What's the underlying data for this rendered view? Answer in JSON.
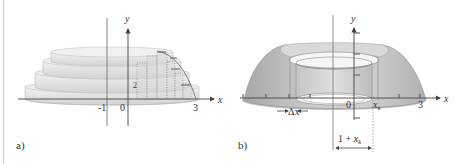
{
  "figure": {
    "panels": [
      {
        "id": "a",
        "label": "a)",
        "description": "Solid of revolution approximated by stacked cylindrical disks (step solid) with dotted rectangles",
        "axes": {
          "x_label": "x",
          "y_label": "y",
          "tick_labels": [
            "-1",
            "0",
            "3"
          ],
          "annotation": "2"
        }
      },
      {
        "id": "b",
        "label": "b)",
        "description": "Solid of revolution about x = -1 with a cylindrical shell of thickness Δx at x_k",
        "axes": {
          "x_label": "x",
          "y_label": "y",
          "tick_labels": [
            "0",
            "x_k",
            "3"
          ]
        },
        "annotations": {
          "shell_thickness": "Δx",
          "shell_position": "x",
          "shell_position_sub": "k",
          "radius_label_prefix": "1 + ",
          "radius_label_var": "x",
          "radius_label_sub": "k"
        }
      }
    ],
    "colors": {
      "solid_light": "#e6e6e6",
      "solid_mid": "#c8c8c8",
      "solid_dark": "#a9a9a9",
      "axis": "#444444",
      "background": "#ffffff"
    }
  }
}
